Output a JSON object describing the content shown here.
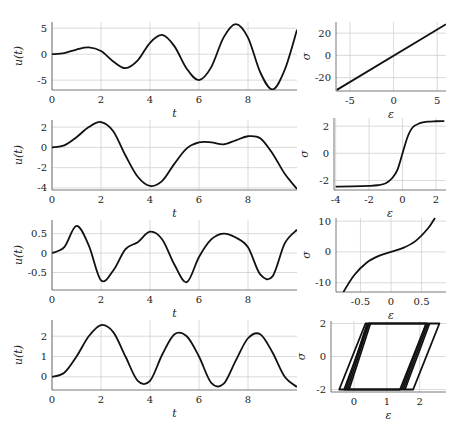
{
  "figure": {
    "rows": 4,
    "columns": 2,
    "left_xlabel": "t",
    "left_ylabel": "u(t)",
    "right_xlabel": "ε",
    "right_ylabel": "σ"
  },
  "chart_data": [
    {
      "type": "line",
      "id": "row1-left",
      "xlabel": "t",
      "ylabel": "u(t)",
      "xlim": [
        0,
        10
      ],
      "ylim": [
        -6.9,
        6.2
      ],
      "xticks": [
        0,
        2,
        4,
        6,
        8
      ],
      "yticks": [
        -5,
        0,
        5
      ],
      "grid": true,
      "x": [
        0,
        0.5,
        1.0,
        1.5,
        2.0,
        2.5,
        3.0,
        3.5,
        4.0,
        4.5,
        5.0,
        5.5,
        6.0,
        6.5,
        7.0,
        7.5,
        8.0,
        8.5,
        9.0,
        9.5,
        10.0
      ],
      "values": [
        0,
        0.2,
        0.9,
        1.3,
        0.6,
        -1.4,
        -2.7,
        -1.2,
        2.2,
        3.7,
        1.5,
        -2.8,
        -5.0,
        -2.5,
        3.2,
        5.8,
        3.2,
        -3.5,
        -6.8,
        -3.0,
        4.7
      ]
    },
    {
      "type": "line",
      "id": "row1-right",
      "xlabel": "ε",
      "ylabel": "σ",
      "xlim": [
        -6.6,
        6
      ],
      "ylim": [
        -32,
        30
      ],
      "xticks": [
        -5,
        0,
        5
      ],
      "yticks": [
        -20,
        0,
        20
      ],
      "grid": true,
      "x": [
        -6.5,
        6
      ],
      "values": [
        -31,
        28
      ]
    },
    {
      "type": "line",
      "id": "row2-left",
      "xlabel": "t",
      "ylabel": "u(t)",
      "xlim": [
        0,
        10
      ],
      "ylim": [
        -4.2,
        2.7
      ],
      "xticks": [
        0,
        2,
        4,
        6,
        8
      ],
      "yticks": [
        -4,
        -2,
        0,
        2
      ],
      "grid": true,
      "x": [
        0,
        0.5,
        1.0,
        1.5,
        2.0,
        2.5,
        3.0,
        3.5,
        4.0,
        4.5,
        5.0,
        5.5,
        6.0,
        6.5,
        7.0,
        7.5,
        8.0,
        8.5,
        9.0,
        9.5,
        10.0
      ],
      "values": [
        0,
        0.2,
        1.0,
        2.0,
        2.5,
        1.6,
        -0.8,
        -2.9,
        -3.8,
        -3.3,
        -1.6,
        -0.1,
        0.5,
        0.5,
        0.3,
        0.7,
        1.1,
        0.9,
        -0.6,
        -2.6,
        -4.1
      ]
    },
    {
      "type": "line",
      "id": "row2-right",
      "xlabel": "ε",
      "ylabel": "σ",
      "xlim": [
        -4.1,
        2.6
      ],
      "ylim": [
        -2.7,
        2.6
      ],
      "xticks": [
        -4,
        -2,
        0,
        2
      ],
      "yticks": [
        -2,
        0,
        2
      ],
      "grid": true,
      "x": [
        -4,
        -3,
        -2,
        -1.5,
        -1,
        -0.6,
        -0.3,
        0,
        0.3,
        0.6,
        1,
        1.5,
        2,
        2.5
      ],
      "values": [
        -2.45,
        -2.44,
        -2.4,
        -2.35,
        -2.2,
        -1.8,
        -1.2,
        0,
        1.2,
        1.9,
        2.2,
        2.33,
        2.36,
        2.37
      ]
    },
    {
      "type": "line",
      "id": "row3-left",
      "xlabel": "t",
      "ylabel": "u(t)",
      "xlim": [
        0,
        10
      ],
      "ylim": [
        -0.95,
        0.85
      ],
      "xticks": [
        0,
        2,
        4,
        6,
        8
      ],
      "yticks": [
        -0.5,
        0,
        0.5
      ],
      "grid": true,
      "x": [
        0,
        0.5,
        1.0,
        1.5,
        2.0,
        2.5,
        3.0,
        3.5,
        4.0,
        4.5,
        5.0,
        5.5,
        6.0,
        6.5,
        7.0,
        7.5,
        8.0,
        8.5,
        9.0,
        9.5,
        10.0
      ],
      "values": [
        0,
        0.15,
        0.7,
        0.2,
        -0.7,
        -0.45,
        0.1,
        0.28,
        0.55,
        0.35,
        -0.3,
        -0.75,
        -0.1,
        0.35,
        0.5,
        0.4,
        0.15,
        -0.55,
        -0.6,
        0.25,
        0.6
      ]
    },
    {
      "type": "line",
      "id": "row3-right",
      "xlabel": "ε",
      "ylabel": "σ",
      "xlim": [
        -0.9,
        0.9
      ],
      "ylim": [
        -13,
        11
      ],
      "xticks": [
        -0.5,
        0,
        0.5
      ],
      "yticks": [
        -10,
        0,
        10
      ],
      "grid": true,
      "x": [
        -0.78,
        -0.6,
        -0.4,
        -0.2,
        0,
        0.2,
        0.4,
        0.6,
        0.72
      ],
      "values": [
        -13,
        -7.5,
        -3.5,
        -1.3,
        0,
        1.3,
        3.5,
        7.5,
        11
      ]
    },
    {
      "type": "line",
      "id": "row4-left",
      "xlabel": "t",
      "ylabel": "u(t)",
      "xlim": [
        0,
        10
      ],
      "ylim": [
        -0.65,
        2.8
      ],
      "xticks": [
        0,
        2,
        4,
        6,
        8
      ],
      "yticks": [
        0,
        1,
        2
      ],
      "grid": true,
      "x": [
        0,
        0.5,
        1.0,
        1.5,
        2.0,
        2.5,
        3.0,
        3.5,
        4.0,
        4.5,
        5.0,
        5.5,
        6.0,
        6.5,
        7.0,
        7.5,
        8.0,
        8.5,
        9.0,
        9.5,
        10.0
      ],
      "values": [
        0,
        0.2,
        1.0,
        2.0,
        2.55,
        2.2,
        1.0,
        -0.2,
        -0.2,
        1.1,
        2.1,
        2.0,
        1.0,
        -0.3,
        -0.35,
        0.8,
        1.9,
        2.1,
        1.2,
        0,
        -0.5
      ]
    },
    {
      "type": "line",
      "id": "row4-right",
      "xlabel": "ε",
      "ylabel": "σ",
      "xlim": [
        -0.7,
        2.8
      ],
      "ylim": [
        -2.15,
        2.15
      ],
      "xticks": [
        0,
        1,
        2
      ],
      "yticks": [
        -2,
        0,
        2
      ],
      "grid": true,
      "description": "hysteresis loops (parallelograms) between σ=-2 and σ=2",
      "loops": [
        {
          "x": [
            -0.45,
            0.35,
            2.6,
            1.8,
            -0.45
          ],
          "values": [
            -2,
            2,
            2,
            -2,
            -2
          ]
        },
        {
          "x": [
            -0.3,
            0.45,
            2.2,
            1.4,
            -0.3
          ],
          "values": [
            -2,
            2,
            2,
            -2,
            -2
          ]
        }
      ]
    }
  ]
}
